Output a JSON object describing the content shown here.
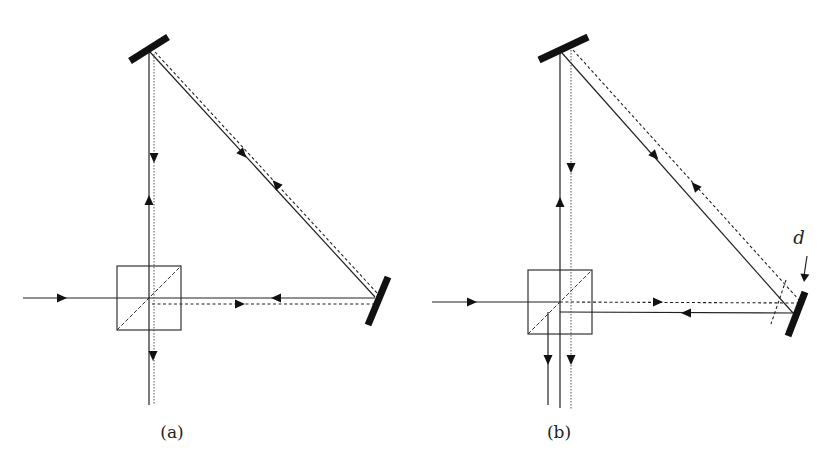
{
  "figure": {
    "panels": [
      {
        "id": "a",
        "caption": "(a)",
        "caption_pos": [
          172,
          438
        ],
        "beam_splitter": {
          "x": 117,
          "y": 266,
          "size": 64
        },
        "mirrors": [
          {
            "name": "top-mirror",
            "x1": 130,
            "y1": 61,
            "x2": 168,
            "y2": 37
          },
          {
            "name": "right-mirror",
            "x1": 368,
            "y1": 325,
            "x2": 388,
            "y2": 277
          }
        ],
        "beams_solid": [
          [
            23,
            298,
            375,
            298
          ],
          [
            149,
            52,
            149,
            405
          ],
          [
            150,
            52,
            375,
            297
          ]
        ],
        "beams_dashed": [
          [
            152,
            304,
            375,
            304
          ],
          [
            155,
            52,
            378,
            294
          ]
        ],
        "beams_dotted": [
          [
            154,
            54,
            154,
            405
          ]
        ],
        "arrows": [
          {
            "x": 62,
            "y": 298,
            "dir": "right"
          },
          {
            "x": 154,
            "y": 158,
            "dir": "down"
          },
          {
            "x": 149,
            "y": 200,
            "dir": "up"
          },
          {
            "x": 243,
            "y": 154,
            "dir": "down-right"
          },
          {
            "x": 276,
            "y": 184,
            "dir": "up-left"
          },
          {
            "x": 240,
            "y": 304,
            "dir": "right"
          },
          {
            "x": 276,
            "y": 298,
            "dir": "left"
          },
          {
            "x": 153,
            "y": 356,
            "dir": "down"
          }
        ]
      },
      {
        "id": "b",
        "caption": "(b)",
        "caption_pos": [
          559,
          438
        ],
        "beam_splitter": {
          "x": 528,
          "y": 270,
          "size": 64
        },
        "mirrors": [
          {
            "name": "top-mirror",
            "x1": 539,
            "y1": 60,
            "x2": 588,
            "y2": 37
          },
          {
            "name": "right-mirror",
            "x1": 788,
            "y1": 336,
            "x2": 805,
            "y2": 292
          }
        ],
        "beams_solid": [
          [
            432,
            302,
            560,
            302
          ],
          [
            560,
            312,
            795,
            313
          ],
          [
            548,
            312,
            548,
            405
          ],
          [
            560,
            52,
            560,
            408
          ],
          [
            562,
            53,
            793,
            313
          ]
        ],
        "beams_dashed": [
          [
            560,
            302,
            800,
            303
          ],
          [
            573,
            50,
            800,
            301
          ],
          [
            786,
            280,
            771,
            324
          ]
        ],
        "beams_dotted": [
          [
            571,
            50,
            571,
            410
          ]
        ],
        "arrows": [
          {
            "x": 472,
            "y": 302,
            "dir": "right"
          },
          {
            "x": 571,
            "y": 168,
            "dir": "down"
          },
          {
            "x": 560,
            "y": 202,
            "dir": "up"
          },
          {
            "x": 655,
            "y": 156,
            "dir": "down-right"
          },
          {
            "x": 695,
            "y": 186,
            "dir": "up-left"
          },
          {
            "x": 658,
            "y": 302,
            "dir": "right"
          },
          {
            "x": 686,
            "y": 313,
            "dir": "left"
          },
          {
            "x": 548,
            "y": 360,
            "dir": "down"
          },
          {
            "x": 571,
            "y": 360,
            "dir": "down"
          }
        ],
        "annotation": {
          "label": "d",
          "label_pos": [
            799,
            244
          ],
          "pointer": [
            807,
            256,
            804,
            282
          ]
        }
      }
    ]
  }
}
